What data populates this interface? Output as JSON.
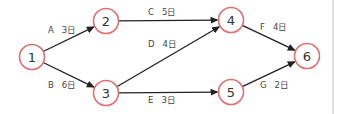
{
  "diagram": {
    "type": "activity-network",
    "colors": {
      "node_stroke": "#e07070",
      "edge": "#222222",
      "text": "#444444"
    },
    "nodes": [
      {
        "id": "1",
        "label": "1",
        "x": 32,
        "y": 57
      },
      {
        "id": "2",
        "label": "2",
        "x": 106,
        "y": 21
      },
      {
        "id": "3",
        "label": "3",
        "x": 106,
        "y": 93
      },
      {
        "id": "4",
        "label": "4",
        "x": 231,
        "y": 20
      },
      {
        "id": "5",
        "label": "5",
        "x": 231,
        "y": 92
      },
      {
        "id": "6",
        "label": "6",
        "x": 307,
        "y": 56
      }
    ],
    "edges": [
      {
        "id": "A",
        "from": "1",
        "to": "2",
        "activity": "A",
        "duration": "3日",
        "label_x": 48,
        "label_y": 33
      },
      {
        "id": "B",
        "from": "1",
        "to": "3",
        "activity": "B",
        "duration": "6日",
        "label_x": 48,
        "label_y": 88
      },
      {
        "id": "C",
        "from": "2",
        "to": "4",
        "activity": "C",
        "duration": "5日",
        "label_x": 148,
        "label_y": 15
      },
      {
        "id": "D",
        "from": "3",
        "to": "4",
        "activity": "D",
        "duration": "4日",
        "label_x": 148,
        "label_y": 47
      },
      {
        "id": "E",
        "from": "3",
        "to": "5",
        "activity": "E",
        "duration": "3日",
        "label_x": 148,
        "label_y": 103
      },
      {
        "id": "F",
        "from": "4",
        "to": "6",
        "activity": "F",
        "duration": "4日",
        "label_x": 260,
        "label_y": 30
      },
      {
        "id": "G",
        "from": "5",
        "to": "6",
        "activity": "G",
        "duration": "2日",
        "label_x": 260,
        "label_y": 88
      }
    ]
  }
}
